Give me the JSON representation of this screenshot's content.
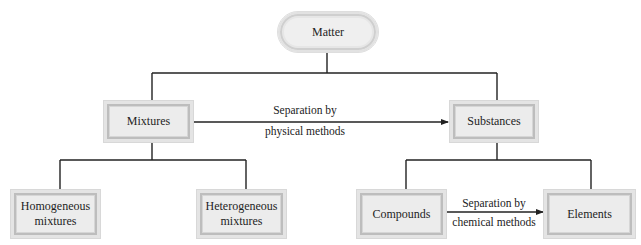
{
  "diagram": {
    "nodes": {
      "matter": {
        "label": "Matter",
        "shape": "pill"
      },
      "mixtures": {
        "label": "Mixtures",
        "shape": "box"
      },
      "substances": {
        "label": "Substances",
        "shape": "box"
      },
      "homogeneous": {
        "line1": "Homogeneous",
        "line2": "mixtures",
        "shape": "box"
      },
      "heterogeneous": {
        "line1": "Heterogeneous",
        "line2": "mixtures",
        "shape": "box"
      },
      "compounds": {
        "label": "Compounds",
        "shape": "box"
      },
      "elements": {
        "label": "Elements",
        "shape": "box"
      }
    },
    "edges": [
      {
        "from": "matter",
        "to": "mixtures",
        "type": "tree"
      },
      {
        "from": "matter",
        "to": "substances",
        "type": "tree"
      },
      {
        "from": "mixtures",
        "to": "homogeneous",
        "type": "tree"
      },
      {
        "from": "mixtures",
        "to": "heterogeneous",
        "type": "tree"
      },
      {
        "from": "substances",
        "to": "compounds",
        "type": "tree"
      },
      {
        "from": "substances",
        "to": "elements",
        "type": "tree"
      },
      {
        "from": "mixtures",
        "to": "substances",
        "type": "arrow",
        "line1": "Separation by",
        "line2": "physical methods"
      },
      {
        "from": "compounds",
        "to": "elements",
        "type": "arrow",
        "line1": "Separation by",
        "line2": "chemical methods"
      }
    ],
    "colors": {
      "line": "#222222",
      "box_fill": "#ececec",
      "box_border": "#bdbdbd"
    }
  }
}
